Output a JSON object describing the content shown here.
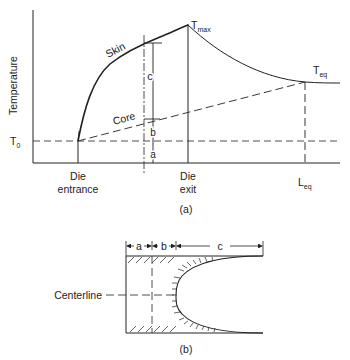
{
  "figure_a": {
    "y_axis_label": "Temperature",
    "t0_label": "T",
    "t0_sub": "0",
    "tmax_label": "T",
    "tmax_sub": "max",
    "teq_label": "T",
    "teq_sub": "eq",
    "skin_label": "Skin",
    "core_label": "Core",
    "seg_a": "a",
    "seg_b": "b",
    "seg_c": "c",
    "die_entrance_line1": "Die",
    "die_entrance_line2": "entrance",
    "die_exit_line1": "Die",
    "die_exit_line2": "exit",
    "leq_label": "L",
    "leq_sub": "eq",
    "caption": "(a)"
  },
  "figure_b": {
    "seg_a": "a",
    "seg_b": "b",
    "seg_c": "c",
    "centerline_label": "Centerline",
    "caption": "(b)"
  },
  "colors": {
    "line": "#222222",
    "background": "#ffffff"
  }
}
